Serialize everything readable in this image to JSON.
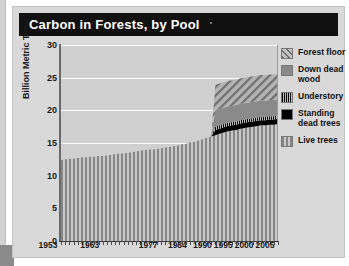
{
  "card": {
    "title": "Carbon in Forests, by Pool"
  },
  "chart_data": {
    "type": "area",
    "title": "Carbon in Forests, by Pool",
    "xlabel": "",
    "ylabel": "Billion Metric Tons",
    "ylim": [
      0,
      30
    ],
    "yticks": [
      0,
      5,
      10,
      15,
      20,
      25,
      30
    ],
    "xticklabels": [
      "1953",
      "1963",
      "1977",
      "1984",
      "1990",
      "1995",
      "2000",
      "2005"
    ],
    "xtickvalues": [
      1953,
      1963,
      1977,
      1984,
      1990,
      1995,
      2000,
      2005
    ],
    "xlim": [
      1953,
      2005
    ],
    "grid": true,
    "legend_position": "right",
    "stacked": true,
    "x": [
      1953,
      1954,
      1955,
      1956,
      1957,
      1958,
      1959,
      1960,
      1961,
      1962,
      1963,
      1964,
      1965,
      1966,
      1967,
      1968,
      1969,
      1970,
      1971,
      1972,
      1973,
      1974,
      1975,
      1976,
      1977,
      1978,
      1979,
      1980,
      1981,
      1982,
      1983,
      1984,
      1985,
      1986,
      1987,
      1988,
      1989,
      1990,
      1991,
      1992,
      1993,
      1994,
      1995,
      1996,
      1997,
      1998,
      1999,
      2000,
      2001,
      2002,
      2003,
      2004,
      2005
    ],
    "series": [
      {
        "name": "Live trees",
        "color": "#8d8d8d",
        "pattern": "vertical-stripes",
        "values": [
          12.4,
          12.5,
          12.6,
          12.6,
          12.7,
          12.8,
          12.8,
          12.9,
          12.9,
          13.0,
          13.0,
          13.1,
          13.2,
          13.3,
          13.4,
          13.4,
          13.5,
          13.6,
          13.7,
          13.8,
          13.9,
          14.0,
          14.0,
          14.1,
          14.2,
          14.3,
          14.4,
          14.5,
          14.6,
          14.8,
          14.9,
          15.1,
          15.2,
          15.4,
          15.6,
          15.8,
          16.0,
          16.2,
          16.4,
          16.6,
          16.8,
          16.9,
          17.0,
          17.2,
          17.3,
          17.4,
          17.5,
          17.6,
          17.7,
          17.7,
          17.8,
          17.8,
          17.9
        ]
      },
      {
        "name": "Standing dead trees",
        "color": "#000000",
        "pattern": "solid-black",
        "values": [
          0,
          0,
          0,
          0,
          0,
          0,
          0,
          0,
          0,
          0,
          0,
          0,
          0,
          0,
          0,
          0,
          0,
          0,
          0,
          0,
          0,
          0,
          0,
          0,
          0,
          0,
          0,
          0,
          0,
          0,
          0,
          0,
          0,
          0,
          0,
          0,
          0,
          0.8,
          0.8,
          0.8,
          0.8,
          0.8,
          0.8,
          0.8,
          0.8,
          0.8,
          0.8,
          0.8,
          0.8,
          0.8,
          0.8,
          0.8,
          0.8
        ]
      },
      {
        "name": "Understory",
        "color": "#1a1a1a",
        "pattern": "narrow-vertical-ticks",
        "values": [
          0,
          0,
          0,
          0,
          0,
          0,
          0,
          0,
          0,
          0,
          0,
          0,
          0,
          0,
          0,
          0,
          0,
          0,
          0,
          0,
          0,
          0,
          0,
          0,
          0,
          0,
          0,
          0,
          0,
          0,
          0,
          0,
          0,
          0,
          0,
          0,
          0,
          0.5,
          0.5,
          0.5,
          0.5,
          0.5,
          0.5,
          0.5,
          0.5,
          0.5,
          0.5,
          0.5,
          0.5,
          0.5,
          0.5,
          0.5,
          0.5
        ]
      },
      {
        "name": "Down dead wood",
        "color": "#8a8a8a",
        "pattern": "solid-gray",
        "values": [
          0,
          0,
          0,
          0,
          0,
          0,
          0,
          0,
          0,
          0,
          0,
          0,
          0,
          0,
          0,
          0,
          0,
          0,
          0,
          0,
          0,
          0,
          0,
          0,
          0,
          0,
          0,
          0,
          0,
          0,
          0,
          0,
          0,
          0,
          0,
          0,
          0,
          2.5,
          2.5,
          2.5,
          2.5,
          2.5,
          2.5,
          2.5,
          2.5,
          2.5,
          2.5,
          2.5,
          2.5,
          2.5,
          2.5,
          2.5,
          2.5
        ]
      },
      {
        "name": "Forest floor",
        "color": "#9b9b9b",
        "pattern": "diagonal-hatch",
        "values": [
          0,
          0,
          0,
          0,
          0,
          0,
          0,
          0,
          0,
          0,
          0,
          0,
          0,
          0,
          0,
          0,
          0,
          0,
          0,
          0,
          0,
          0,
          0,
          0,
          0,
          0,
          0,
          0,
          0,
          0,
          0,
          0,
          0,
          0,
          0,
          0,
          0,
          3.9,
          3.9,
          3.9,
          3.9,
          3.9,
          3.9,
          3.9,
          3.9,
          3.9,
          3.9,
          3.9,
          3.9,
          3.9,
          3.9,
          3.9,
          3.9
        ]
      }
    ]
  },
  "legend": {
    "items": [
      {
        "label": "Forest floor",
        "swatch": "diagonal-hatch"
      },
      {
        "label": "Down dead\nwood",
        "swatch": "solid-gray"
      },
      {
        "label": "Understory",
        "swatch": "narrow-vertical-ticks"
      },
      {
        "label": "Standing\ndead trees",
        "swatch": "solid-black"
      },
      {
        "label": "Live trees",
        "swatch": "vertical-stripes"
      }
    ]
  }
}
